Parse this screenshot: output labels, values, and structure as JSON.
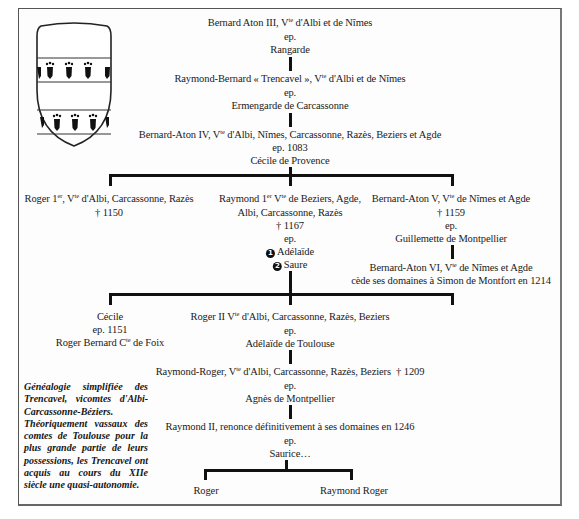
{
  "figure": {
    "type": "genealogy-tree",
    "coat_of_arms": {
      "icon": "shield-icon",
      "description": "Trencavel arms: shield with two bands of ermine-like black charges"
    },
    "caption": "Généalogie simplifiée des Trencavel, vicomtes d'Albi-Carcassonne-Béziers. Théoriquement vassaux des comtes de Toulouse pour la plus grande partie de leurs possessions, les Trencavel ont acquis au cours du XIIe siècle une quasi-autonomie."
  },
  "gen1": {
    "name": "Bernard Aton III, V",
    "sup": "te",
    "rest": " d'Albi et de Nîmes",
    "ep": "ep.",
    "spouse": "Rangarde"
  },
  "gen2": {
    "name": "Raymond-Bernard « Trencavel », V",
    "sup": "te",
    "rest": " d'Albi et de Nîmes",
    "ep": "ep.",
    "spouse": "Ermengarde de Carcassonne"
  },
  "gen3": {
    "name": "Bernard-Aton IV, V",
    "sup": "te",
    "rest": " d'Albi, Nîmes, Carcassonne, Razès, Beziers et Agde",
    "ep": "ep. 1083",
    "spouse": "Cécile de Provence"
  },
  "gen4": {
    "roger1": {
      "name": "Roger 1",
      "sup1": "er",
      "mid": ", V",
      "sup2": "te",
      "rest": " d'Albi, Carcassonne, Razès",
      "death": "† 1150"
    },
    "raymond1": {
      "line1_a": "Raymond 1",
      "sup1": "er",
      "line1_b": " V",
      "sup2": "te",
      "line1_c": " de Beziers, Agde,",
      "line2": "Albi, Carcassonne, Razès",
      "death": "† 1167",
      "ep": "ep.",
      "spouse1_num": "1",
      "spouse1": "Adélaïde",
      "spouse2_num": "2",
      "spouse2": "Saure"
    },
    "bernard5": {
      "name": "Bernard-Aton V, V",
      "sup": "te",
      "rest": " de Nîmes et Agde",
      "death": "† 1159",
      "ep": "ep.",
      "spouse": "Guillemette de Montpellier"
    },
    "bernard6": {
      "name": "Bernard-Aton VI, V",
      "sup": "te",
      "rest": " de Nîmes et Agde",
      "note": "cède ses domaines à Simon de Montfort en 1214"
    }
  },
  "gen5": {
    "cecile": {
      "name": "Cécile",
      "ep": "ep. 1151",
      "spouse_a": "Roger Bernard C",
      "sup": "te",
      "spouse_b": " de Foix"
    },
    "roger2": {
      "name": "Roger II V",
      "sup": "te",
      "rest": " d'Albi, Carcassonne, Razès, Beziers",
      "ep": "ep.",
      "spouse": "Adélaïde de Toulouse"
    }
  },
  "gen6": {
    "name": "Raymond-Roger, V",
    "sup": "te",
    "rest": " d'Albi, Carcassonne, Razès, Beziers  † 1209",
    "ep": "ep.",
    "spouse": "Agnès de Montpellier"
  },
  "gen7": {
    "name": "Raymond II, renonce définitivement à ses domaines en 1246",
    "ep": "ep.",
    "spouse": "Saurice…"
  },
  "gen8": {
    "child1": "Roger",
    "child2": "Raymond Roger"
  },
  "colors": {
    "ink": "#111111",
    "frame": "#555555",
    "background": "#ffffff"
  }
}
